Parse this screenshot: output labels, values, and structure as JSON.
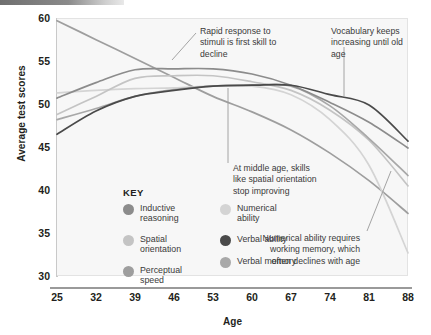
{
  "figure": {
    "background": "#ffffff",
    "plot_background": "#f7f7f7",
    "top_bar_color": "#6f6f6f"
  },
  "axes": {
    "ylabel": "Average test scores",
    "xlabel": "Age",
    "yticks": [
      "60",
      "55",
      "50",
      "45",
      "40",
      "35",
      "30"
    ],
    "xticks": [
      "25",
      "32",
      "39",
      "46",
      "53",
      "60",
      "67",
      "74",
      "81",
      "88"
    ]
  },
  "key": {
    "title": "KEY",
    "column_left": [
      {
        "label": "Inductive reasoning",
        "color": "#8c8c8c"
      },
      {
        "label": "Spatial orientation",
        "color": "#c4c4c4"
      },
      {
        "label": "Perceptual speed",
        "color": "#9e9e9e"
      }
    ],
    "column_right": [
      {
        "label": "Numerical ability",
        "color": "#d4d4d4"
      },
      {
        "label": "Verbal ability",
        "color": "#4a4a4a"
      },
      {
        "label": "Verbal memory",
        "color": "#a8a8a8"
      }
    ]
  },
  "annotations": [
    {
      "id": "rapid-response",
      "text": "Rapid response to stimuli is first skill to decline"
    },
    {
      "id": "vocabulary",
      "text": "Vocabulary keeps increasing until old age"
    },
    {
      "id": "middle-age",
      "text": "At middle age, skills like spatial orientation stop improving"
    },
    {
      "id": "numerical",
      "text": "Numerical ability requires working memory, which often declines with age"
    }
  ],
  "chart_data": {
    "type": "line",
    "title": "",
    "xlabel": "Age",
    "ylabel": "Average test scores",
    "xlim": [
      25,
      88
    ],
    "ylim": [
      30,
      60
    ],
    "grid": false,
    "legend_position": "inside-lower-left",
    "x": [
      25,
      32,
      39,
      46,
      53,
      60,
      67,
      74,
      81,
      88
    ],
    "series": [
      {
        "name": "Inductive reasoning",
        "color": "#8c8c8c",
        "values": [
          50.8,
          52.6,
          54.1,
          54.2,
          54.2,
          53.6,
          52.3,
          50.3,
          48.0,
          45.0
        ]
      },
      {
        "name": "Spatial orientation",
        "color": "#c4c4c4",
        "values": [
          48.9,
          51.0,
          53.1,
          53.4,
          53.4,
          52.7,
          51.7,
          49.4,
          45.9,
          40.6
        ]
      },
      {
        "name": "Perceptual speed",
        "color": "#9e9e9e",
        "values": [
          59.8,
          57.6,
          55.4,
          53.2,
          51.0,
          49.2,
          47.1,
          44.4,
          41.2,
          37.4
        ]
      },
      {
        "name": "Numerical ability",
        "color": "#d4d4d4",
        "values": [
          51.4,
          51.7,
          51.9,
          52.0,
          52.2,
          52.2,
          51.2,
          48.3,
          43.0,
          32.8
        ]
      },
      {
        "name": "Verbal ability",
        "color": "#4a4a4a",
        "values": [
          46.6,
          49.3,
          51.0,
          51.7,
          52.2,
          52.3,
          52.3,
          51.2,
          50.0,
          45.8
        ]
      },
      {
        "name": "Verbal memory",
        "color": "#a8a8a8",
        "values": [
          48.3,
          49.6,
          51.0,
          51.8,
          52.2,
          52.3,
          52.2,
          49.9,
          46.1,
          41.8
        ]
      }
    ]
  }
}
